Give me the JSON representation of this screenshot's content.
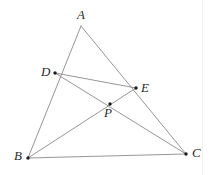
{
  "figure": {
    "kind": "geometry-diagram",
    "canvas": {
      "width": 213,
      "height": 175,
      "background": "#ffffff"
    },
    "style": {
      "line_color": "#8a8a8a",
      "line_width": 0.9,
      "point_color": "#1c1c1c",
      "point_radius": 1.7,
      "label_color": "#2b2b2b",
      "label_font_size": 13,
      "page_edge_color": "#f0f0f0"
    },
    "points": [
      {
        "id": "A",
        "label": "A",
        "x": 81,
        "y": 26,
        "marked": false,
        "label_x": 77,
        "label_y": 8
      },
      {
        "id": "D",
        "label": "D",
        "x": 55,
        "y": 73,
        "marked": true,
        "label_x": 41,
        "label_y": 65
      },
      {
        "id": "E",
        "label": "E",
        "x": 136,
        "y": 88,
        "marked": true,
        "label_x": 141,
        "label_y": 81
      },
      {
        "id": "P",
        "label": "P",
        "x": 110,
        "y": 104,
        "marked": true,
        "label_x": 104,
        "label_y": 106
      },
      {
        "id": "B",
        "label": "B",
        "x": 28,
        "y": 158,
        "marked": true,
        "label_x": 14,
        "label_y": 149
      },
      {
        "id": "C",
        "label": "C",
        "x": 186,
        "y": 154,
        "marked": true,
        "label_x": 192,
        "label_y": 146
      }
    ],
    "segments": [
      {
        "id": "AB",
        "from": "A",
        "to": "B"
      },
      {
        "id": "AC",
        "from": "A",
        "to": "C"
      },
      {
        "id": "BC",
        "from": "B",
        "to": "C"
      },
      {
        "id": "DE",
        "from": "D",
        "to": "E"
      },
      {
        "id": "DC",
        "from": "D",
        "to": "C"
      },
      {
        "id": "BE",
        "from": "B",
        "to": "E"
      }
    ],
    "page_edge": {
      "visible": true,
      "x": 202
    }
  }
}
